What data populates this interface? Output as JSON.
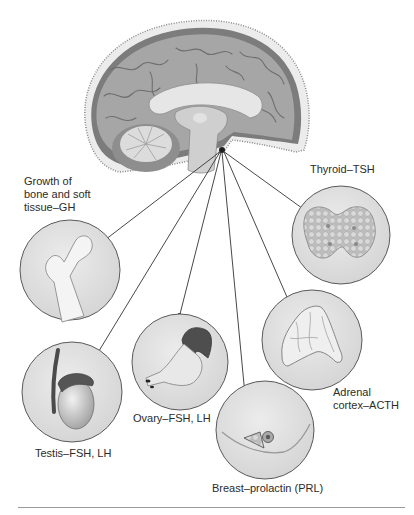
{
  "figure": {
    "source_gland": "pituitary",
    "targets": [
      {
        "id": "bone",
        "label": "Growth of\nbone and soft\ntissue–GH",
        "hormone": "GH"
      },
      {
        "id": "thyroid",
        "label": "Thyroid–TSH",
        "hormone": "TSH"
      },
      {
        "id": "adrenal",
        "label": "Adrenal\ncortex–ACTH",
        "hormone": "ACTH"
      },
      {
        "id": "breast",
        "label": "Breast–prolactin (PRL)",
        "hormone": "PRL"
      },
      {
        "id": "ovary",
        "label": "Ovary–FSH, LH",
        "hormone": "FSH, LH"
      },
      {
        "id": "testis",
        "label": "Testis–FSH, LH",
        "hormone": "FSH, LH"
      }
    ]
  },
  "colors": {
    "circle_fill": "#e2e2e2",
    "circle_stroke": "#5a5a5a",
    "arrow": "#333333",
    "brain_gray": "#9c9c9c",
    "brain_light": "#d8d8d8",
    "organ_dark": "#4a4a4a"
  }
}
